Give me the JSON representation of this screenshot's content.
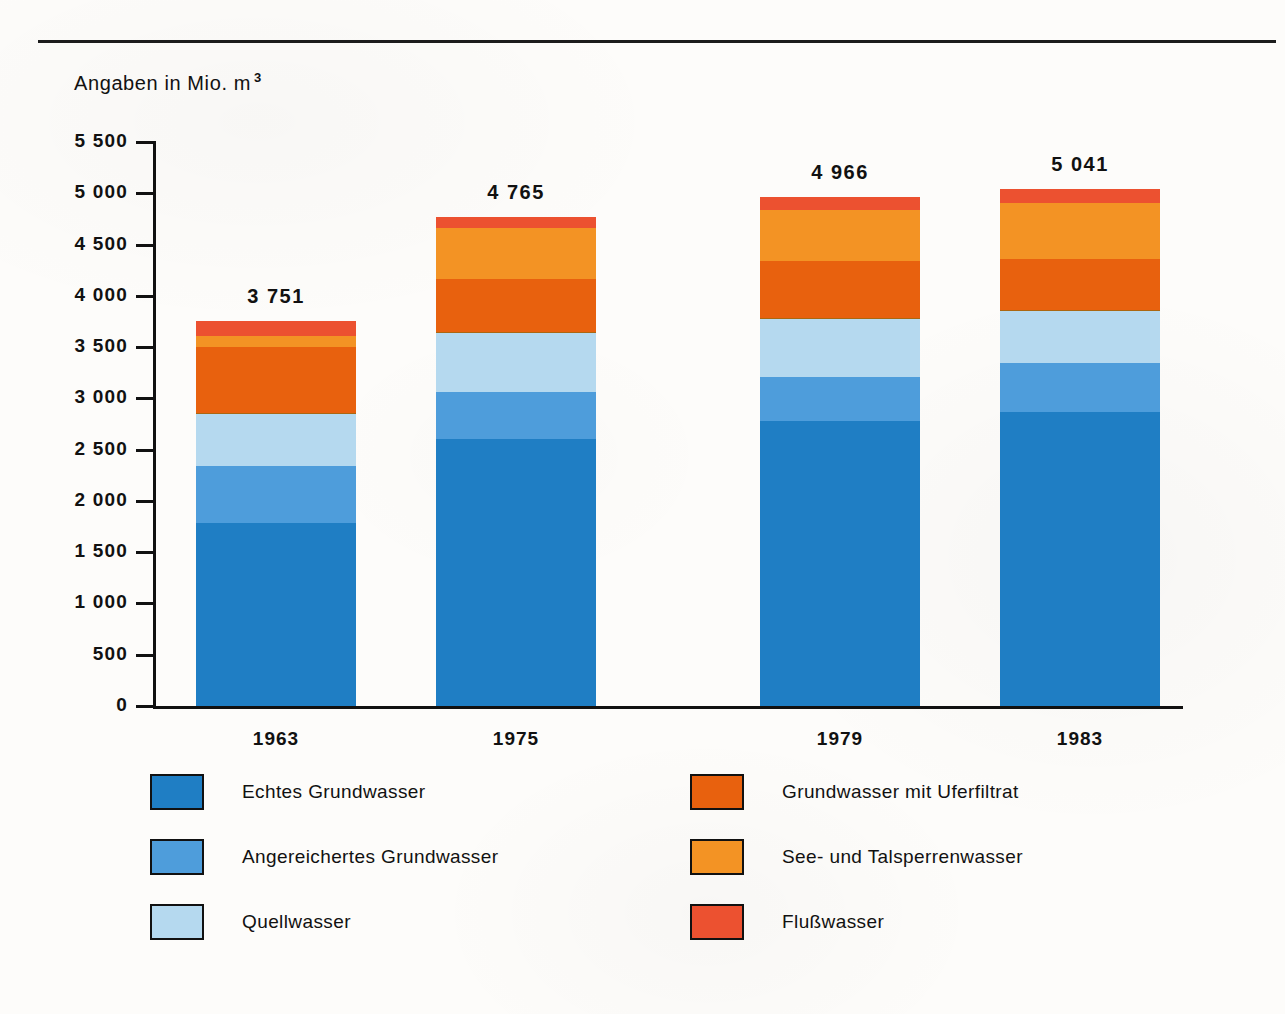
{
  "header": {
    "unit_note": "Angaben in Mio. m",
    "unit_exponent": "3"
  },
  "chart_data": {
    "type": "bar",
    "subtype": "stacked",
    "title": "",
    "subtitle": "",
    "xlabel": "",
    "ylabel": "Angaben in Mio. m3",
    "categories": [
      "1963",
      "1975",
      "1979",
      "1983"
    ],
    "ylim": [
      0,
      5500
    ],
    "ytick_values": [
      0,
      500,
      1000,
      1500,
      2000,
      2500,
      3000,
      3500,
      4000,
      4500,
      5000,
      5500
    ],
    "ytick_labels": [
      "0",
      "500",
      "1 000",
      "1 500",
      "2 000",
      "2 500",
      "3 000",
      "3 500",
      "4 000",
      "4 500",
      "5 000",
      "5 500"
    ],
    "grid": false,
    "legend_position": "bottom",
    "totals": [
      3751,
      4765,
      4966,
      5041
    ],
    "total_labels": [
      "3 751",
      "4 765",
      "4 966",
      "5 041"
    ],
    "series": [
      {
        "name": "Echtes Grundwasser",
        "color": "#1f7ec4",
        "values": [
          1780,
          2930,
          3000,
          3205
        ]
      },
      {
        "name": "Angereichertes Grundwasser",
        "color": "#4e9ddb",
        "values": [
          560,
          520,
          470,
          535
        ]
      },
      {
        "name": "Quellwasser",
        "color": "#b5d9ef",
        "values": [
          510,
          640,
          605,
          565
        ]
      },
      {
        "name": "Grundwasser mit Uferfiltrat",
        "color": "#e8610e",
        "values": [
          650,
          600,
          610,
          570
        ]
      },
      {
        "name": "See- und Talsperrenwasser",
        "color": "#f39324",
        "values": [
          105,
          560,
          540,
          615
        ]
      },
      {
        "name": "Flußwasser",
        "color": "#ec5130",
        "values": [
          146,
          115,
          141,
          151
        ]
      }
    ]
  },
  "legend": {
    "left_items": [
      {
        "label": "Echtes Grundwasser",
        "color": "#1f7ec4"
      },
      {
        "label": "Angereichertes Grundwasser",
        "color": "#4e9ddb"
      },
      {
        "label": "Quellwasser",
        "color": "#b5d9ef"
      }
    ],
    "right_items": [
      {
        "label": "Grundwasser mit Uferfiltrat",
        "color": "#e8610e"
      },
      {
        "label": "See- und Talsperrenwasser",
        "color": "#f39324"
      },
      {
        "label": "Flußwasser",
        "color": "#ec5130"
      }
    ]
  }
}
